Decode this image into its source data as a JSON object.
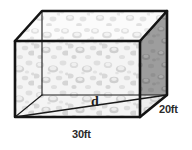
{
  "figure": {
    "shape_name": "rectangular-prism",
    "labels": {
      "width": "30ft",
      "depth": "20ft",
      "diagonal": "d"
    },
    "colors": {
      "edge": "#1a1a1a",
      "front_face": "#f2f2f2",
      "top_face": "#fafafa",
      "right_face": "#9a9a9a",
      "background": "#ffffff",
      "speckle_light": "#d9d9d9",
      "speckle_mid": "#bfbfbf",
      "speckle_dark": "#a6a6a6"
    },
    "geometry": {
      "front_top_left": [
        15,
        41
      ],
      "front_top_right": [
        140,
        41
      ],
      "front_bottom_left": [
        15,
        117
      ],
      "front_bottom_right": [
        140,
        117
      ],
      "back_top_left": [
        42,
        11
      ],
      "back_top_right": [
        167,
        11
      ],
      "back_bottom_left": [
        42,
        95
      ],
      "back_bottom_right": [
        167,
        95
      ],
      "diagonal_from": [
        15,
        117
      ],
      "diagonal_to": [
        167,
        95
      ]
    }
  }
}
